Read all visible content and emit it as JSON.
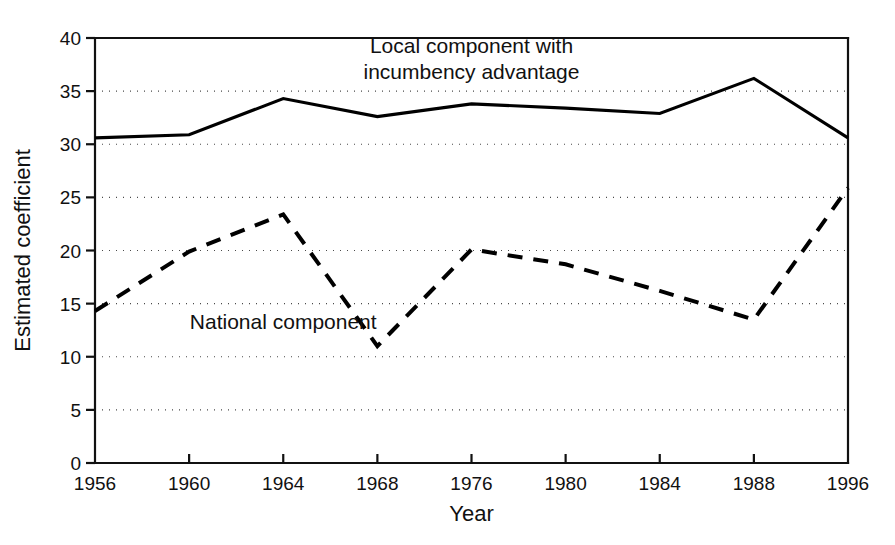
{
  "chart_data": {
    "type": "line",
    "title": "",
    "xlabel": "Year",
    "ylabel": "Estimated coefficient",
    "categories": [
      "1956",
      "1960",
      "1964",
      "1968",
      "1976",
      "1980",
      "1984",
      "1988",
      "1996"
    ],
    "ylim": [
      0,
      40
    ],
    "yticks": [
      0,
      5,
      10,
      15,
      20,
      25,
      30,
      35,
      40
    ],
    "ytick_labels": [
      "0",
      "5",
      "10",
      "15",
      "20",
      "25",
      "30",
      "35",
      "40"
    ],
    "grid": "horizontal-dotted",
    "legend": "inline-annotations",
    "series": [
      {
        "name": "Local component with incumbency advantage",
        "style": "solid",
        "color": "#000000",
        "values": [
          30.6,
          30.9,
          34.3,
          32.6,
          33.8,
          33.4,
          32.9,
          36.2,
          30.6
        ]
      },
      {
        "name": "National component",
        "style": "dashed",
        "color": "#000000",
        "values": [
          14.3,
          19.9,
          23.4,
          11.0,
          20.1,
          18.7,
          16.2,
          13.5,
          25.9
        ]
      }
    ],
    "annotations": [
      {
        "id": "local-series-label",
        "lines": [
          "Local component with",
          "incumbency advantage"
        ],
        "x_category_index": 4,
        "y_value": 38.6,
        "align": "middle"
      },
      {
        "id": "national-series-label",
        "lines": [
          "National component"
        ],
        "x_category_index": 2,
        "y_value": 12.6,
        "align": "middle"
      }
    ]
  },
  "geometry": {
    "plot_left": 95,
    "plot_right": 848,
    "plot_top": 38,
    "plot_bottom": 463,
    "tick_length": 9,
    "ytick_label_dx": -14,
    "xtick_label_dy": 27,
    "xlabel_y": 521,
    "ylabel_x": 30
  }
}
